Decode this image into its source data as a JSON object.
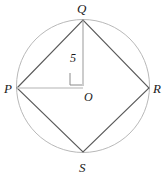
{
  "figure": {
    "type": "geometry-diagram",
    "background_color": "#ffffff",
    "circle": {
      "name": "circumscribed-circle",
      "center_x": 83,
      "center_y": 86,
      "radius": 66.5,
      "stroke_color": "#b0b0b0",
      "stroke_width": 0.9,
      "fill": "none"
    },
    "center_point": {
      "name": "O",
      "x": 83,
      "y": 86
    },
    "vertices": [
      {
        "name": "P",
        "label": "P",
        "x": 17,
        "y": 88,
        "label_x": 4,
        "label_y": 93
      },
      {
        "name": "Q",
        "label": "Q",
        "x": 83,
        "y": 20,
        "label_x": 77,
        "label_y": 13
      },
      {
        "name": "R",
        "label": "R",
        "x": 149,
        "y": 88,
        "label_x": 153,
        "label_y": 93
      },
      {
        "name": "S",
        "label": "S",
        "x": 83,
        "y": 152,
        "label_x": 79,
        "label_y": 172
      }
    ],
    "quadrilateral": {
      "name": "quadrilateral-PQRS",
      "points": "17,88 83,20 149,88 83,152",
      "stroke_color": "#5a5a5a",
      "stroke_width": 1.1,
      "fill": "none"
    },
    "segments": [
      {
        "name": "radius-O-to-Q",
        "x1": 83,
        "y1": 86,
        "x2": 83,
        "y2": 20,
        "stroke_color": "#999999",
        "stroke_width": 1.0,
        "measure_label": "5",
        "measure_label_x": 70,
        "measure_label_y": 62
      },
      {
        "name": "segment-P-to-O",
        "x1": 17,
        "y1": 88,
        "x2": 83,
        "y2": 88,
        "stroke_color": "#cccccc",
        "stroke_width": 1.4,
        "measure_label": "",
        "measure_label_x": 0,
        "measure_label_y": 0
      }
    ],
    "right_angle_marker": {
      "name": "right-angle-marker-at-O",
      "points": "70,73 70,85 82,85",
      "stroke_color": "#8a8a8a",
      "stroke_width": 1.0
    },
    "center_label": {
      "text": "O",
      "x": 84,
      "y": 101
    },
    "measure_text": "5"
  }
}
